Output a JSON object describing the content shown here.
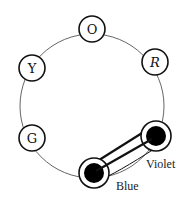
{
  "diagram": {
    "ring": {
      "cx": 92,
      "cy": 106,
      "r": 72,
      "stroke": "#555555"
    },
    "nodes": [
      {
        "id": "O",
        "label": "O",
        "cx": 92,
        "cy": 29,
        "filled": false
      },
      {
        "id": "R",
        "label": "R",
        "cx": 155,
        "cy": 62,
        "filled": false
      },
      {
        "id": "Y",
        "label": "Y",
        "cx": 32,
        "cy": 68,
        "filled": false
      },
      {
        "id": "G",
        "label": "G",
        "cx": 32,
        "cy": 138,
        "filled": false
      },
      {
        "id": "Violet",
        "label": "",
        "cx": 156,
        "cy": 136,
        "filled": true,
        "caption": "Violet"
      },
      {
        "id": "Blue",
        "label": "",
        "cx": 94,
        "cy": 173,
        "filled": true,
        "caption": "Blue"
      }
    ],
    "connections": [
      {
        "from": "Violet",
        "to": "Blue",
        "style": "double-line"
      }
    ],
    "captions": {
      "violet": "Violet",
      "blue": "Blue"
    },
    "colors": {
      "stroke": "#111111",
      "fill": "#000000",
      "background": "#ffffff"
    }
  }
}
